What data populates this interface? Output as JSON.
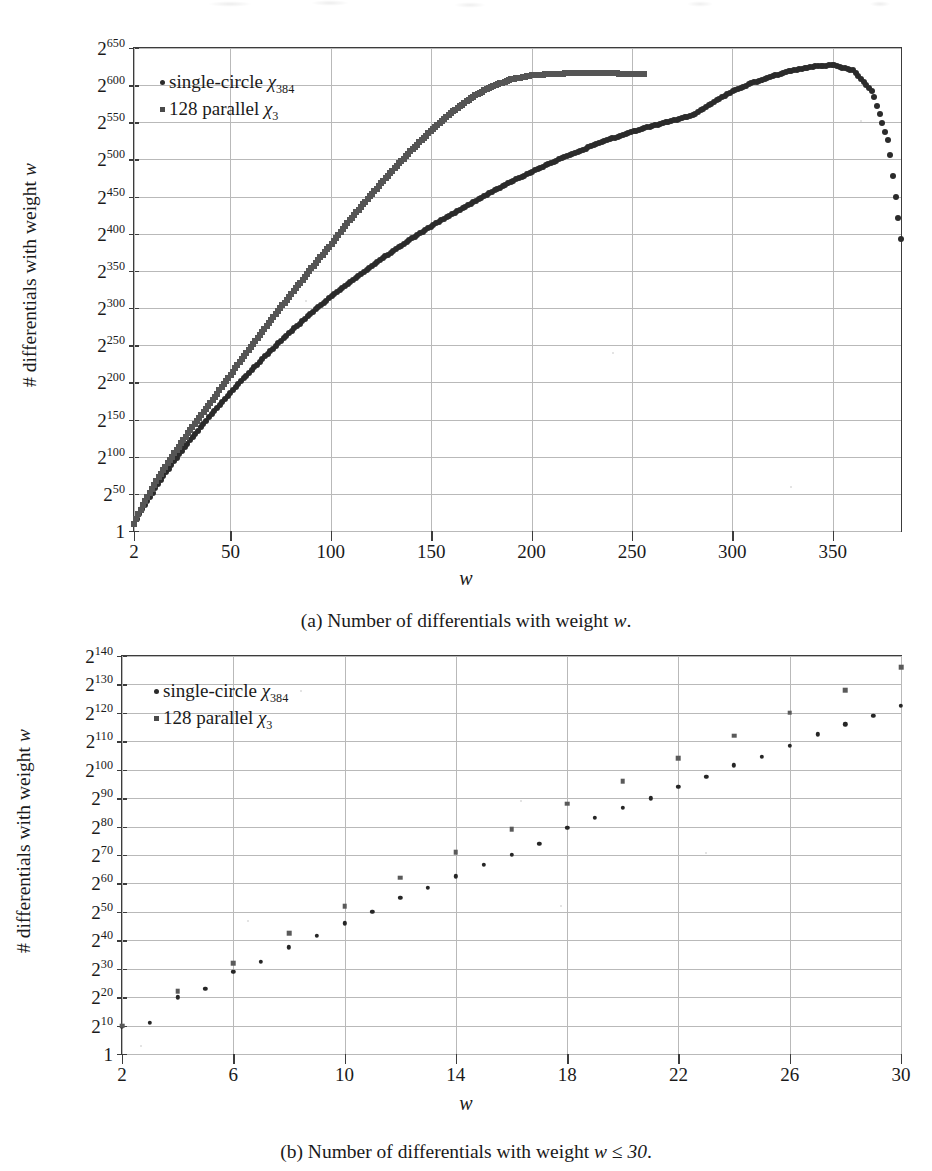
{
  "figures": [
    {
      "id": "a",
      "caption_prefix": "(a) Number of differentials with weight ",
      "caption_var": "w",
      "caption_suffix": ".",
      "legend": [
        {
          "marker": "dot",
          "label_main": "single-circle ",
          "label_sym": "χ",
          "label_sub": "384"
        },
        {
          "marker": "square",
          "label_main": "128 parallel ",
          "label_sym": "χ",
          "label_sub": "3"
        }
      ]
    },
    {
      "id": "b",
      "caption_prefix": "(b) Number of differentials with weight ",
      "caption_var": "w ≤ 30",
      "caption_suffix": ".",
      "legend": [
        {
          "marker": "dot",
          "label_main": "single-circle ",
          "label_sym": "χ",
          "label_sub": "384"
        },
        {
          "marker": "square",
          "label_main": "128 parallel ",
          "label_sym": "χ",
          "label_sub": "3"
        }
      ]
    }
  ],
  "axis_titles": {
    "y": "# differentials with weight w",
    "y_plain": "# differentials with weight ",
    "y_var": "w",
    "x": "w"
  },
  "colors": {
    "series_single_circle": "#2b2b2b",
    "series_128_parallel": "#555555",
    "frame": "#3c3c3c",
    "grid": "#b9b9b9",
    "background": "#ffffff"
  },
  "chart_data": [
    {
      "type": "scatter",
      "panel": "a",
      "title": "Number of differentials with weight w",
      "xlabel": "w",
      "ylabel": "# differentials with weight w",
      "yscale": "log2",
      "xlim": [
        2,
        384
      ],
      "ylim_exponent": [
        0,
        650
      ],
      "grid": true,
      "legend_position": "top-left",
      "xticks": [
        2,
        50,
        100,
        150,
        200,
        250,
        300,
        350
      ],
      "xtick_labels": [
        "2",
        "50",
        "100",
        "150",
        "200",
        "250",
        "300",
        "350"
      ],
      "yticks_exponent": [
        0,
        50,
        100,
        150,
        200,
        250,
        300,
        350,
        400,
        450,
        500,
        550,
        600,
        650
      ],
      "ytick_labels": [
        "1",
        "2^50",
        "2^100",
        "2^150",
        "2^200",
        "2^250",
        "2^300",
        "2^350",
        "2^400",
        "2^450",
        "2^500",
        "2^550",
        "2^600",
        "2^650"
      ],
      "series": [
        {
          "name": "single-circle χ384",
          "marker": "dot",
          "color": "#2b2b2b",
          "x": [
            2,
            6,
            10,
            14,
            18,
            22,
            26,
            30,
            36,
            42,
            48,
            54,
            60,
            68,
            76,
            84,
            92,
            100,
            110,
            120,
            130,
            140,
            150,
            160,
            170,
            180,
            190,
            200,
            210,
            220,
            230,
            240,
            250,
            260,
            270,
            275,
            280,
            290,
            300,
            310,
            320,
            330,
            340,
            350,
            360,
            370,
            378,
            384
          ],
          "y_exponent": [
            10,
            30,
            46,
            63,
            79,
            94,
            108,
            122,
            142,
            162,
            180,
            198,
            215,
            237,
            258,
            278,
            297,
            315,
            336,
            356,
            375,
            393,
            410,
            426,
            441,
            456,
            470,
            483,
            496,
            507,
            518,
            528,
            537,
            545,
            552,
            556,
            559,
            576,
            592,
            603,
            612,
            620,
            625,
            627,
            620,
            590,
            520,
            393
          ]
        },
        {
          "name": "128 parallel χ3",
          "marker": "square",
          "color": "#555555",
          "x": [
            2,
            4,
            6,
            8,
            10,
            12,
            14,
            16,
            18,
            20,
            22,
            24,
            26,
            28,
            30,
            40,
            50,
            60,
            70,
            80,
            90,
            100,
            110,
            120,
            130,
            140,
            150,
            160,
            170,
            180,
            190,
            200,
            210,
            220,
            230,
            240,
            250,
            256
          ],
          "y_exponent": [
            10,
            22,
            32,
            42,
            52,
            62,
            71,
            79,
            88,
            96,
            104,
            112,
            120,
            128,
            136,
            172,
            210,
            247,
            283,
            318,
            352,
            385,
            420,
            452,
            483,
            512,
            539,
            563,
            583,
            598,
            608,
            613,
            615,
            616,
            616,
            616,
            615,
            615
          ]
        }
      ],
      "annotations": [
        {
          "text": "single-circle curve peaks near w≈275 at about 2^637, then falls to about 2^393 at w=384"
        },
        {
          "text": "128 parallel series terminates near w≈256 at about 2^615"
        }
      ]
    },
    {
      "type": "scatter",
      "panel": "b",
      "title": "Number of differentials with weight w ≤ 30",
      "xlabel": "w",
      "ylabel": "# differentials with weight w",
      "yscale": "log2",
      "xlim": [
        2,
        30
      ],
      "ylim_exponent": [
        0,
        140
      ],
      "grid": true,
      "legend_position": "top-left",
      "xticks": [
        2,
        6,
        10,
        14,
        18,
        22,
        26,
        30
      ],
      "xtick_labels": [
        "2",
        "6",
        "10",
        "14",
        "18",
        "22",
        "26",
        "30"
      ],
      "yticks_exponent": [
        0,
        10,
        20,
        30,
        40,
        50,
        60,
        70,
        80,
        90,
        100,
        110,
        120,
        130,
        140
      ],
      "ytick_labels": [
        "1",
        "2^10",
        "2^20",
        "2^30",
        "2^40",
        "2^50",
        "2^60",
        "2^70",
        "2^80",
        "2^90",
        "2^100",
        "2^110",
        "2^120",
        "2^130",
        "2^140"
      ],
      "series": [
        {
          "name": "single-circle χ384",
          "marker": "dot",
          "color": "#262626",
          "x": [
            2,
            3,
            4,
            5,
            6,
            7,
            8,
            9,
            10,
            11,
            12,
            13,
            14,
            15,
            16,
            17,
            18,
            19,
            20,
            21,
            22,
            23,
            24,
            25,
            26,
            27,
            28,
            29,
            30
          ],
          "y_exponent": [
            9.5,
            11,
            20,
            23,
            29,
            32.5,
            37.5,
            41.5,
            46,
            50,
            55,
            58.5,
            62.5,
            66.5,
            70,
            74,
            79.5,
            83,
            86.5,
            90,
            94,
            97.5,
            101.5,
            104.5,
            108.5,
            112.5,
            116,
            119,
            122.5
          ]
        },
        {
          "name": "128 parallel χ3",
          "marker": "square",
          "color": "#5a5a5a",
          "x": [
            2,
            4,
            6,
            8,
            10,
            12,
            14,
            16,
            18,
            20,
            22,
            24,
            26,
            28,
            30
          ],
          "y_exponent": [
            10,
            22,
            32,
            42.5,
            52,
            62,
            71,
            79,
            88,
            96,
            104,
            112,
            120,
            128,
            136
          ]
        }
      ]
    }
  ]
}
